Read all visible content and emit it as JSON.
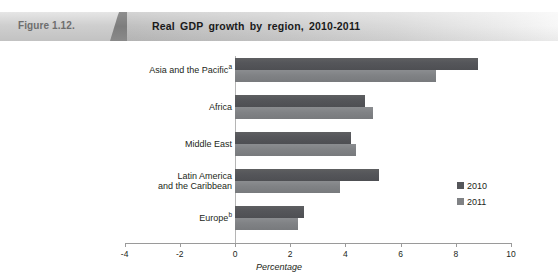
{
  "header": {
    "figure_number": "Figure 1.12.",
    "title": "Real GDP growth by region, 2010-2011"
  },
  "chart_data": {
    "type": "bar",
    "orientation": "horizontal",
    "title": "Real GDP growth by region, 2010-2011",
    "xlabel": "Percentage",
    "ylabel": "",
    "xlim": [
      -4,
      10
    ],
    "xticks": [
      -4,
      -2,
      0,
      2,
      4,
      6,
      8,
      10
    ],
    "xtick_labels": [
      "-4",
      "-2",
      "0",
      "2",
      "4",
      "6",
      "8",
      "10"
    ],
    "grid": false,
    "legend_position": "center-right",
    "categories": [
      "Asia and the Pacific",
      "Africa",
      "Middle East",
      "Latin America and the Caribbean",
      "Europe"
    ],
    "category_footnotes": [
      "a",
      "",
      "",
      "",
      "b"
    ],
    "series": [
      {
        "name": "2010",
        "color": "#55565a",
        "values": [
          8.8,
          4.7,
          4.2,
          5.2,
          2.5
        ]
      },
      {
        "name": "2011",
        "color": "#808285",
        "values": [
          7.3,
          5.0,
          4.4,
          3.8,
          2.3
        ]
      }
    ]
  },
  "legend": {
    "items": [
      {
        "label": "2010",
        "swatch": "#55565a"
      },
      {
        "label": "2011",
        "swatch": "#808285"
      }
    ]
  },
  "colors": {
    "series_2010": "#55565a",
    "series_2011": "#808285",
    "axis": "#9a9a9a",
    "text": "#231f20"
  }
}
